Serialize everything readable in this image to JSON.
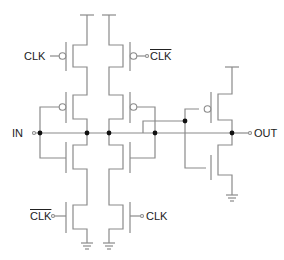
{
  "diagram": {
    "type": "CMOS clocked inverter (C2MOS) driving a static inverter",
    "labels": {
      "clk_top_left": "CLK",
      "clk_bar_top_right": "CLK",
      "input": "IN",
      "output": "OUT",
      "clk_bar_bottom_left": "CLK",
      "clk_bottom_right": "CLK"
    },
    "colors": {
      "wire": "#8a8a8a",
      "node": "#111111",
      "text": "#222222"
    }
  }
}
